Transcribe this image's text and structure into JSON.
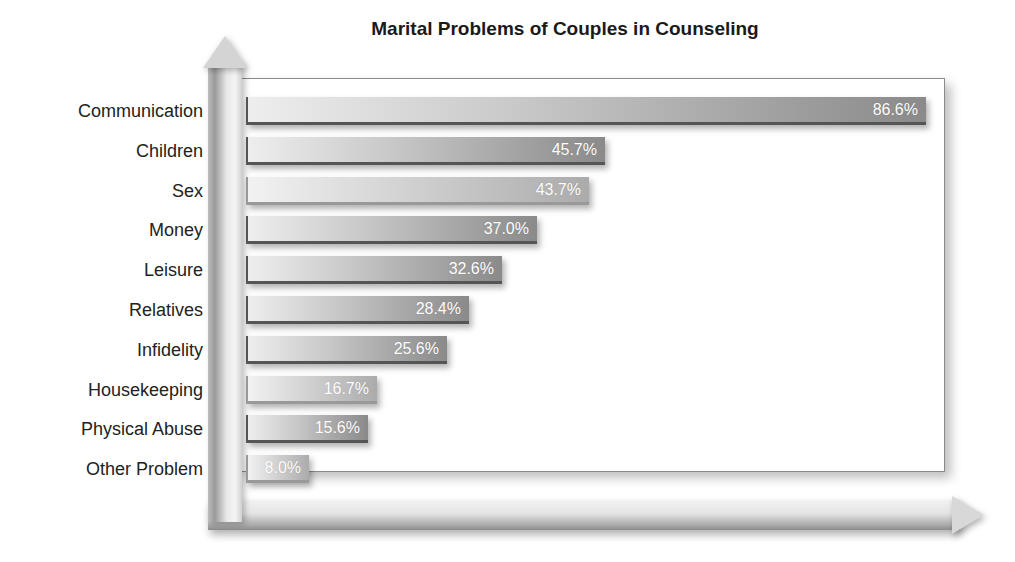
{
  "chart_data": {
    "type": "bar",
    "orientation": "horizontal",
    "title": "Marital Problems of Couples in Counseling",
    "xlabel": "",
    "ylabel": "",
    "categories": [
      "Communication",
      "Children",
      "Sex",
      "Money",
      "Leisure",
      "Relatives",
      "Infidelity",
      "Housekeeping",
      "Physical Abuse",
      "Other Problem"
    ],
    "values": [
      86.6,
      45.7,
      43.7,
      37.0,
      32.6,
      28.4,
      25.6,
      16.7,
      15.6,
      8.0
    ],
    "value_labels": [
      "86.6%",
      "45.7%",
      "43.7%",
      "37.0%",
      "32.6%",
      "28.4%",
      "25.6%",
      "16.7%",
      "15.6%",
      "8.0%"
    ],
    "unit": "%",
    "xlim": [
      0,
      90
    ],
    "grid": false,
    "legend": null
  },
  "colors": {
    "bar_dark_end": "#8a8a8a",
    "bar_light_end": "#ababab",
    "label_text": "#222222",
    "value_text": "#ffffff"
  }
}
